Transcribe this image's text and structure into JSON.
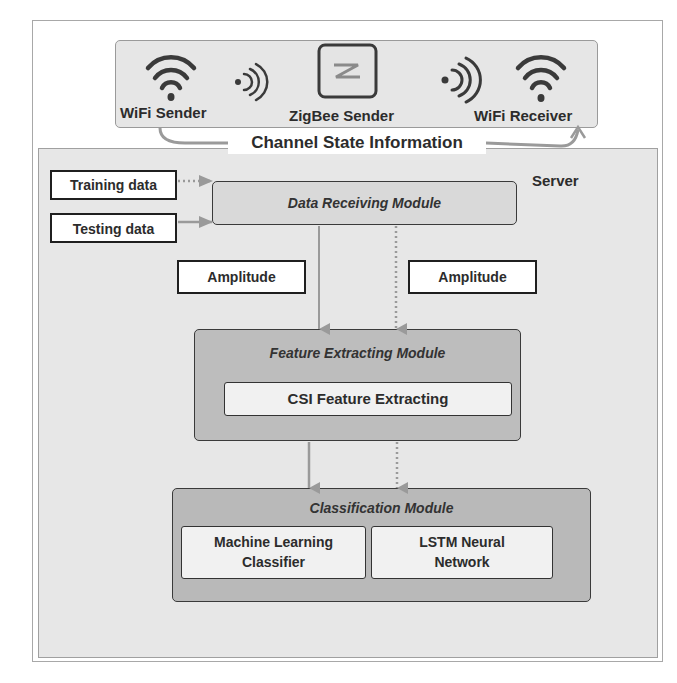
{
  "diagram": {
    "devices": [
      {
        "label": "WiFi Sender",
        "icon": "wifi-icon"
      },
      {
        "label": "ZigBee Sender",
        "icon": "zigbee-icon"
      },
      {
        "label": "WiFi Receiver",
        "icon": "wifi-icon"
      }
    ],
    "signals": [
      "signal-waves-icon",
      "signal-waves-icon"
    ],
    "csi_label": "Channel State Information",
    "server_label": "Server",
    "inputs": {
      "training": "Training data",
      "testing": "Testing data"
    },
    "data_receiving_module": "Data Receiving Module",
    "amplitude_left": "Amplitude",
    "amplitude_right": "Amplitude",
    "feature_module": {
      "title": "Feature Extracting Module",
      "component": "CSI Feature Extracting"
    },
    "classification_module": {
      "title": "Classification Module",
      "components": [
        {
          "line1": "Machine Learning",
          "line2": "Classifier"
        },
        {
          "line1": "LSTM Neural",
          "line2": "Network"
        }
      ]
    },
    "legend": {
      "solid_arrow": "testing path",
      "dotted_arrow": "training path"
    },
    "colors": {
      "panel_gray": "#e7e7e7",
      "module_gray": "#b9b9b9",
      "module_receiving": "#d6d6d6",
      "arrow_gray": "#9a9a9a",
      "border_dark": "#2a2a2a"
    }
  }
}
